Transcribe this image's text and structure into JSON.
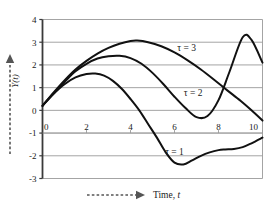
{
  "chart_data": {
    "type": "line",
    "title": "",
    "xlabel": "Time, t",
    "ylabel": "Y(t)",
    "xlim": [
      0,
      10
    ],
    "ylim": [
      -3,
      4
    ],
    "xticks": [
      0,
      2,
      4,
      6,
      8,
      10
    ],
    "xtick_labels": [
      "0",
      "2",
      "4",
      "6",
      "8",
      "10"
    ],
    "yticks": [
      -3,
      -2,
      -1,
      0,
      1,
      2,
      3,
      4
    ],
    "ytick_labels": [
      "-3",
      "-2",
      "-1",
      "0",
      "1",
      "2",
      "3",
      "4"
    ],
    "grid": "horizontal",
    "legend": "inline-annotations",
    "line_color": "#111111",
    "grid_color": "#9a9a9a",
    "axis_color": "#3a3a3a",
    "series": [
      {
        "name": "τ = 1",
        "label": "τ = 1",
        "label_x": 6.0,
        "label_y": -1.95,
        "x": [
          0,
          0.5,
          1.0,
          1.5,
          2.0,
          2.4,
          2.8,
          3.2,
          3.6,
          4.0,
          4.4,
          4.8,
          5.2,
          5.6,
          6.0,
          6.4,
          6.8,
          7.2,
          7.6,
          8.0,
          8.3,
          8.7,
          9.1,
          9.5,
          10.0
        ],
        "y": [
          0.2,
          0.72,
          1.15,
          1.45,
          1.6,
          1.62,
          1.53,
          1.3,
          0.95,
          0.5,
          0.0,
          -0.6,
          -1.2,
          -1.85,
          -2.3,
          -2.38,
          -2.2,
          -2.0,
          -1.85,
          -1.75,
          -1.72,
          -1.7,
          -1.62,
          -1.45,
          -1.2
        ]
      },
      {
        "name": "τ = 2",
        "label": "τ = 2",
        "label_x": 6.85,
        "label_y": 0.62,
        "x": [
          0,
          0.5,
          1.0,
          1.5,
          2.0,
          2.5,
          3.0,
          3.5,
          4.0,
          4.5,
          5.0,
          5.5,
          6.0,
          6.5,
          7.0,
          7.5,
          8.0,
          8.5,
          9.1,
          9.5,
          10.0
        ],
        "y": [
          0.2,
          0.75,
          1.25,
          1.72,
          2.05,
          2.28,
          2.38,
          2.4,
          2.3,
          2.05,
          1.65,
          1.15,
          0.6,
          0.1,
          -0.3,
          -0.25,
          0.45,
          1.7,
          3.22,
          3.1,
          2.1
        ]
      },
      {
        "name": "τ = 3",
        "label": "τ = 3",
        "label_x": 6.55,
        "label_y": 2.62,
        "x": [
          0,
          0.5,
          1.0,
          1.5,
          2.0,
          2.5,
          3.0,
          3.5,
          4.0,
          4.3,
          4.8,
          5.4,
          6.0,
          6.6,
          7.2,
          7.8,
          8.4,
          9.0,
          9.5,
          10.0
        ],
        "y": [
          0.2,
          0.78,
          1.32,
          1.8,
          2.18,
          2.5,
          2.75,
          2.93,
          3.05,
          3.07,
          3.0,
          2.82,
          2.55,
          2.2,
          1.8,
          1.35,
          0.88,
          0.42,
          0.0,
          -0.45
        ]
      }
    ]
  },
  "axes": {
    "y_caption": "Y(t)",
    "y_caption_var": "Y",
    "y_caption_arg": "(t)",
    "x_caption": "Time, t",
    "x_caption_word": "Time,",
    "x_caption_var": "t",
    "arrow_style": "dashed-arrow"
  }
}
